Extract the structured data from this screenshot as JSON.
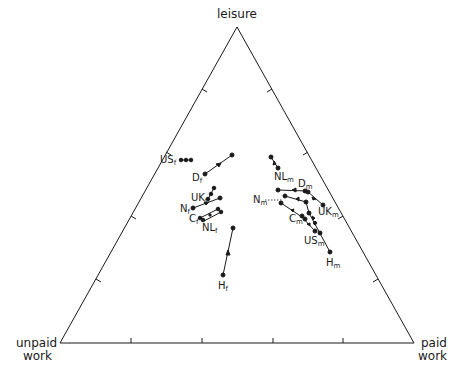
{
  "diagram": {
    "type": "ternary",
    "vertices": {
      "top": {
        "label": "leisure"
      },
      "left": {
        "label_line1": "unpaid",
        "label_line2": "work"
      },
      "right": {
        "label_line1": "paid",
        "label_line2": "work"
      }
    },
    "line_color": "#1a1a1a",
    "groups": {
      "female": [
        {
          "name": "US",
          "sub": "f",
          "points": [
            [
              181,
              160
            ],
            [
              186,
              160
            ],
            [
              191,
              160
            ]
          ]
        },
        {
          "name": "D",
          "sub": "f",
          "points": [
            [
              205,
              174
            ],
            [
              232,
              155
            ]
          ]
        },
        {
          "name": "UK",
          "sub": "f",
          "points": [
            [
              208,
              198
            ],
            [
              211,
              193
            ],
            [
              213,
              189
            ]
          ]
        },
        {
          "name": "N",
          "sub": "f",
          "points": [
            [
              194,
              208
            ],
            [
              220,
              198
            ]
          ]
        },
        {
          "name": "C",
          "sub": "f",
          "points": [
            [
              202,
              219
            ],
            [
              220,
              212
            ],
            [
              217,
              208
            ],
            [
              199,
              215
            ]
          ]
        },
        {
          "name": "NL",
          "sub": "f",
          "points": [
            [
              208,
              223
            ]
          ]
        },
        {
          "name": "H",
          "sub": "f",
          "points": [
            [
              223,
              275
            ],
            [
              233,
              228
            ]
          ]
        }
      ],
      "male": [
        {
          "name": "NL",
          "sub": "m",
          "points": [
            [
              271,
              157
            ],
            [
              278,
              167
            ]
          ]
        },
        {
          "name": "D",
          "sub": "m",
          "points": [
            [
              278,
              190
            ],
            [
              301,
              192
            ],
            [
              307,
              195
            ],
            [
              319,
              202
            ]
          ]
        },
        {
          "name": "UK",
          "sub": "m",
          "points": [
            [
              283,
              197
            ],
            [
              305,
              201
            ],
            [
              308,
              212
            ],
            [
              318,
              219
            ]
          ]
        },
        {
          "name": "N",
          "sub": "m",
          "points": [
            [
              281,
              202
            ]
          ]
        },
        {
          "name": "C",
          "sub": "m",
          "points": [
            [
              279,
              207
            ],
            [
              302,
              217
            ],
            [
              306,
              221
            ],
            [
              315,
              230
            ]
          ]
        },
        {
          "name": "US",
          "sub": "m",
          "points": [
            [
              322,
              234
            ]
          ]
        },
        {
          "name": "H",
          "sub": "m",
          "points": [
            [
              309,
              224
            ],
            [
              330,
              252
            ]
          ]
        }
      ]
    }
  }
}
